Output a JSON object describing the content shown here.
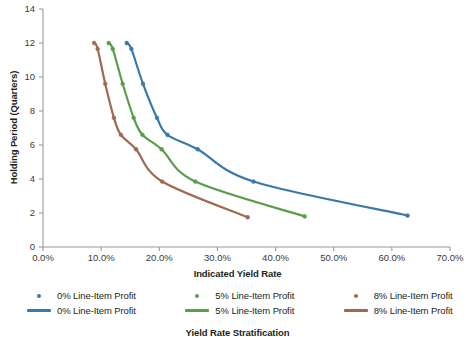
{
  "chart_data": {
    "type": "line",
    "title": "Yield Rate Stratification",
    "xlabel": "Indicated Yield Rate",
    "ylabel": "Holding Period (Quarters)",
    "xlim": [
      0,
      70
    ],
    "ylim": [
      0,
      14
    ],
    "xticks": [
      "0.0%",
      "10.0%",
      "20.0%",
      "30.0%",
      "40.0%",
      "50.0%",
      "60.0%",
      "70.0%"
    ],
    "xtick_values": [
      0,
      10,
      20,
      30,
      40,
      50,
      60,
      70
    ],
    "yticks": [
      "0",
      "2",
      "4",
      "6",
      "8",
      "10",
      "12",
      "14"
    ],
    "ytick_values": [
      0,
      2,
      4,
      6,
      8,
      10,
      12,
      14
    ],
    "grid": false,
    "legend_position": "bottom",
    "series": [
      {
        "name": "0% Line-Item Profit",
        "color": "#3b79a8",
        "x": [
          14.4,
          15.2,
          17.2,
          19.6,
          21.4,
          26.6,
          36.2,
          62.7
        ],
        "y": [
          12.0,
          11.65,
          9.6,
          7.6,
          6.6,
          5.75,
          3.85,
          1.85
        ]
      },
      {
        "name": "5% Line-Item Profit",
        "color": "#5a9e4b",
        "x": [
          11.3,
          12.0,
          13.7,
          15.6,
          17.1,
          20.4,
          26.2,
          45.0
        ],
        "y": [
          12.0,
          11.65,
          9.6,
          7.6,
          6.6,
          5.75,
          3.85,
          1.8
        ]
      },
      {
        "name": "8% Line-Item Profit",
        "color": "#9c6b52",
        "x": [
          8.8,
          9.4,
          10.7,
          12.2,
          13.4,
          16.0,
          20.5,
          35.2
        ],
        "y": [
          12.0,
          11.65,
          9.6,
          7.6,
          6.6,
          5.75,
          3.85,
          1.75
        ]
      }
    ]
  },
  "axes": {
    "y_title": "Holding Period (Quarters)",
    "x_title": "Indicated Yield Rate",
    "y_tick_labels": [
      "14",
      "12",
      "10",
      "8",
      "6",
      "4",
      "2",
      "0"
    ],
    "x_tick_labels": [
      "0.0%",
      "10.0%",
      "20.0%",
      "30.0%",
      "40.0%",
      "50.0%",
      "60.0%",
      "70.0%"
    ]
  },
  "legend": {
    "markers_row": [
      {
        "label": "0% Line-Item Profit",
        "color": "#3b79a8"
      },
      {
        "label": "5% Line-Item Profit",
        "color": "#5a9e4b"
      },
      {
        "label": "8% Line-Item Profit",
        "color": "#9c6b52"
      }
    ],
    "lines_row": [
      {
        "label": "0% Line-Item Profit",
        "color": "#3b79a8"
      },
      {
        "label": "5% Line-Item Profit",
        "color": "#5a9e4b"
      },
      {
        "label": "8% Line-Item Profit",
        "color": "#9c6b52"
      }
    ]
  },
  "caption": "Yield Rate Stratification",
  "colors": {
    "series_0pct": "#3b79a8",
    "series_5pct": "#5a9e4b",
    "series_8pct": "#9c6b52",
    "axis": "#9a9a9a",
    "text": "#231f20",
    "background": "#ffffff"
  }
}
